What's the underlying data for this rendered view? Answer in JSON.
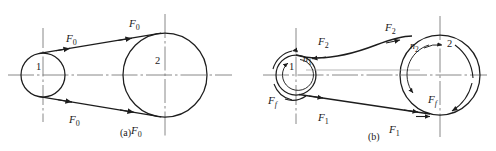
{
  "figure": {
    "stroke_color": "#1d1d1d",
    "centerline_color": "#6e6e6e",
    "background": "#ffffff"
  },
  "panels": [
    {
      "id": "a",
      "caption": "(a)",
      "caption_x": 120,
      "caption_y": 136,
      "description": "Belt drive at rest with equal initial tension on both sides",
      "pulleys": [
        {
          "name": "driving-pulley",
          "label": "1",
          "cx": 43,
          "cy": 75,
          "r": 22,
          "label_x": 36,
          "label_y": 70
        },
        {
          "name": "driven-pulley",
          "label": "2",
          "cx": 165,
          "cy": 75,
          "r": 42,
          "label_x": 155,
          "label_y": 64
        }
      ],
      "force_labels": [
        {
          "text": "F",
          "sub": "0",
          "x": 66,
          "y": 42
        },
        {
          "text": "F",
          "sub": "0",
          "x": 129,
          "y": 27
        },
        {
          "text": "F",
          "sub": "0",
          "x": 69,
          "y": 123
        },
        {
          "text": "F",
          "sub": "0",
          "x": 131,
          "y": 134
        }
      ]
    },
    {
      "id": "b",
      "caption": "(b)",
      "caption_x": 368,
      "caption_y": 140,
      "description": "Belt drive in operation: tight side F1, slack side F2, friction Ff, rotation n1 and n2",
      "pulleys": [
        {
          "name": "driving-pulley",
          "label": "1",
          "cx": 296,
          "cy": 75,
          "r": 20,
          "label_x": 289,
          "label_y": 70
        },
        {
          "name": "driven-pulley",
          "label": "2",
          "cx": 440,
          "cy": 75,
          "r": 40,
          "label_x": 447,
          "label_y": 47
        }
      ],
      "rotation_labels": [
        {
          "text": "n",
          "sub": "1",
          "x": 303,
          "y": 62
        },
        {
          "text": "n",
          "sub": "2",
          "x": 410,
          "y": 49
        }
      ],
      "force_labels": [
        {
          "text": "F",
          "sub": "2",
          "x": 318,
          "y": 45
        },
        {
          "text": "F",
          "sub": "2",
          "x": 385,
          "y": 31
        },
        {
          "text": "F",
          "sub": "1",
          "x": 318,
          "y": 121
        },
        {
          "text": "F",
          "sub": "1",
          "x": 389,
          "y": 133
        },
        {
          "text": "F",
          "sub": "f",
          "x": 268,
          "y": 104
        },
        {
          "text": "F",
          "sub": "f",
          "x": 428,
          "y": 103
        }
      ]
    }
  ]
}
